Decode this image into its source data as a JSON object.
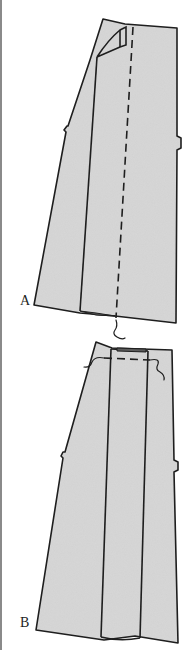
{
  "figure": {
    "type": "sewing-illustration",
    "fabric_color": "#d2d2d2",
    "line_color": "#1e1e1e",
    "steps": [
      {
        "label": "A",
        "description": "pleat folded, basted along dashed line, thread tail at hem"
      },
      {
        "label": "B",
        "description": "pleat pressed flat, basted across top, thread tails at waist"
      }
    ]
  }
}
